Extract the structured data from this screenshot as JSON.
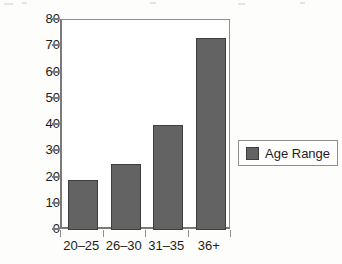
{
  "chart_data": {
    "type": "bar",
    "title": "",
    "xlabel": "",
    "ylabel": "",
    "categories": [
      "20–25",
      "26–30",
      "31–35",
      "36+"
    ],
    "values": [
      19,
      25,
      40,
      73
    ],
    "series": [
      {
        "name": "Age Range",
        "values": [
          19,
          25,
          40,
          73
        ]
      }
    ],
    "ylim": [
      0,
      80
    ],
    "yticks": [
      0,
      10,
      20,
      30,
      40,
      50,
      60,
      70,
      80
    ],
    "ytick_labels": [
      "0",
      "10",
      "20",
      "30",
      "40",
      "50",
      "60",
      "70",
      "80"
    ],
    "grid": false,
    "legend": {
      "position": "right",
      "entries": [
        {
          "label": "Age Range",
          "color": "#636363"
        }
      ]
    },
    "colors": {
      "bar_fill": "#636363",
      "bar_border": "#3e3e3e",
      "axis": "#7a7a7a",
      "frame": "#8d8d8d",
      "text": "#1c1c1c",
      "background": "#ffffff"
    }
  }
}
